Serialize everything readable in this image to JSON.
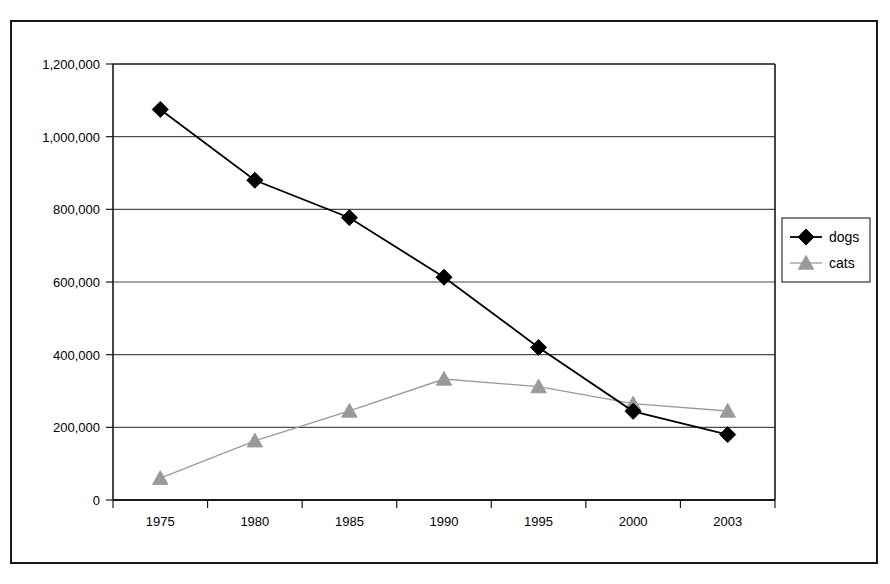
{
  "chart_data": {
    "type": "line",
    "title": "",
    "xlabel": "",
    "ylabel": "",
    "categories": [
      "1975",
      "1980",
      "1985",
      "1990",
      "1995",
      "2000",
      "2003"
    ],
    "ylim": [
      0,
      1200000
    ],
    "ytick_labels": [
      "1,200,000",
      "1,000,000",
      "800,000",
      "600,000",
      "400,000",
      "200,000",
      "0"
    ],
    "ytick_values": [
      1200000,
      1000000,
      800000,
      600000,
      400000,
      200000,
      0
    ],
    "grid": "horizontal",
    "legend_position": "right",
    "series": [
      {
        "name": "dogs",
        "marker": "diamond",
        "color": "#000000",
        "values": [
          1075000,
          880000,
          777000,
          613000,
          420000,
          244000,
          180000
        ]
      },
      {
        "name": "cats",
        "marker": "triangle",
        "color": "#9a9a9a",
        "values": [
          60000,
          163000,
          245000,
          333000,
          312000,
          265000,
          245000
        ]
      }
    ]
  },
  "legend": {
    "entries": [
      {
        "label": "dogs"
      },
      {
        "label": "cats"
      }
    ]
  },
  "colors": {
    "dogs": "#000000",
    "cats": "#9a9a9a",
    "axis": "#1a1a1a",
    "grid": "#4d4d4d",
    "background": "#ffffff"
  }
}
